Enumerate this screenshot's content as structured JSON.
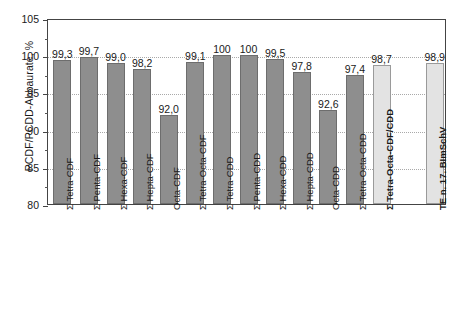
{
  "chart_data": {
    "type": "bar",
    "title": "",
    "xlabel": "",
    "ylabel": "PCDF/PCDD-Abbaurate, %",
    "ylim": [
      80,
      105
    ],
    "ytick_labels": [
      "80",
      "85",
      "90",
      "95",
      "100",
      "105"
    ],
    "ytick_values": [
      80,
      85,
      90,
      95,
      100,
      105
    ],
    "yminor_values": [
      82.5,
      87.5,
      92.5,
      97.5,
      102.5
    ],
    "grid": "horizontal-dotted",
    "legend": "none",
    "categories": [
      "Σ Tetra-CDF",
      "Σ Penta-CDF",
      "Σ Hexa-CDF",
      "Σ Hepta-CDF",
      "Octa-CDF",
      "Σ Tetra-Octa-CDF",
      "Σ Tetra-CDD",
      "Σ Penta-CDD",
      "Σ Hexa-CDD",
      "Σ Hepta-CDD",
      "Octa-CDD",
      "Σ Tetra-Octa-CDD",
      "Σ Tetra-Octa-CDF/CDD",
      "TE n. 17. BImSchV"
    ],
    "values": [
      99.3,
      99.7,
      99.0,
      98.2,
      92.0,
      99.1,
      100,
      100,
      99.5,
      97.8,
      92.6,
      97.4,
      98.7,
      98.9
    ],
    "value_labels": [
      "99,3",
      "99,7",
      "99,0",
      "98,2",
      "92,0",
      "99,1",
      "100",
      "100",
      "99,5",
      "97,8",
      "92,6",
      "97,4",
      "98,7",
      "98,9"
    ],
    "bar_styles": [
      "dark",
      "dark",
      "dark",
      "dark",
      "dark",
      "dark",
      "dark",
      "dark",
      "dark",
      "dark",
      "dark",
      "dark",
      "light",
      "light"
    ],
    "label_bold": [
      false,
      false,
      false,
      false,
      false,
      false,
      false,
      false,
      false,
      false,
      false,
      false,
      true,
      true
    ],
    "slot_index": [
      0,
      1,
      2,
      3,
      4,
      5,
      6,
      7,
      8,
      9,
      10,
      11,
      12,
      14
    ],
    "colors": {
      "bar_dark_fill": "#8e8e8e",
      "bar_dark_stroke": "#6d6d6d",
      "bar_light_fill": "#e3e3e3",
      "bar_light_stroke": "#9a9a9a",
      "axis": "#444444",
      "grid": "#a9a9a9",
      "text": "#1a1a1a",
      "background": "#ffffff"
    }
  }
}
